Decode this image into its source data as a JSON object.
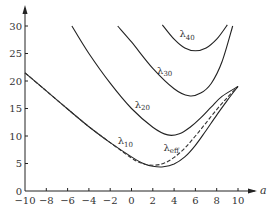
{
  "chart_data": {
    "type": "line",
    "title": "",
    "xlabel": "a",
    "ylabel": "",
    "xlim": [
      -10,
      11
    ],
    "ylim": [
      0,
      32
    ],
    "grid": false,
    "legend": "inline curve labels",
    "x_ticks": [
      -10,
      -8,
      -6,
      -4,
      -2,
      0,
      2,
      4,
      6,
      8,
      10
    ],
    "y_ticks": [
      0,
      5,
      10,
      15,
      20,
      25,
      30
    ],
    "series": [
      {
        "name": "λ10",
        "label_main": "λ",
        "label_sub": "10",
        "style": "solid",
        "label_pos": [
          -1.3,
          8.5
        ],
        "points": [
          [
            -10,
            21.5
          ],
          [
            -8,
            18.2
          ],
          [
            -6,
            14.9
          ],
          [
            -4,
            11.7
          ],
          [
            -2,
            8.8
          ],
          [
            0,
            6.2
          ],
          [
            1,
            5.1
          ],
          [
            2,
            4.5
          ],
          [
            3,
            4.4
          ],
          [
            4,
            4.9
          ],
          [
            5,
            6.2
          ],
          [
            6,
            8.3
          ],
          [
            7,
            11.0
          ],
          [
            8,
            13.8
          ],
          [
            9,
            16.5
          ],
          [
            10,
            19.0
          ]
        ]
      },
      {
        "name": "λeff",
        "label_main": "λ",
        "label_sub": "eff",
        "style": "dashed",
        "label_pos": [
          3.0,
          7.3
        ],
        "points": [
          [
            -10,
            21.5
          ],
          [
            -8,
            18.2
          ],
          [
            -6,
            14.9
          ],
          [
            -4,
            11.7
          ],
          [
            -2,
            8.8
          ],
          [
            0,
            6.0
          ],
          [
            1,
            5.0
          ],
          [
            2,
            4.7
          ],
          [
            3,
            5.0
          ],
          [
            4,
            6.1
          ],
          [
            5,
            7.8
          ],
          [
            6,
            10.0
          ],
          [
            7,
            12.4
          ],
          [
            8,
            14.8
          ],
          [
            9,
            17.0
          ],
          [
            10,
            19.0
          ]
        ]
      },
      {
        "name": "λ20",
        "label_main": "λ",
        "label_sub": "20",
        "style": "solid",
        "label_pos": [
          0.3,
          15.1
        ],
        "points": [
          [
            -5.6,
            30
          ],
          [
            -4,
            25.0
          ],
          [
            -2,
            19.6
          ],
          [
            0,
            15.0
          ],
          [
            2,
            11.6
          ],
          [
            3.4,
            10.2
          ],
          [
            4.5,
            10.4
          ],
          [
            5.5,
            11.6
          ],
          [
            6.5,
            13.3
          ],
          [
            7.5,
            15.3
          ],
          [
            8.5,
            17.2
          ],
          [
            10,
            19.0
          ]
        ]
      },
      {
        "name": "λ30",
        "label_main": "λ",
        "label_sub": "30",
        "style": "solid",
        "label_pos": [
          2.4,
          21.3
        ],
        "points": [
          [
            -1.3,
            30
          ],
          [
            0,
            27.1
          ],
          [
            2,
            22.3
          ],
          [
            4,
            18.6
          ],
          [
            5.4,
            17.3
          ],
          [
            6.5,
            17.8
          ],
          [
            7.5,
            19.6
          ],
          [
            8.5,
            23.5
          ],
          [
            9.5,
            30
          ]
        ]
      },
      {
        "name": "λ40",
        "label_main": "λ",
        "label_sub": "40",
        "style": "solid",
        "label_pos": [
          4.5,
          28.0
        ],
        "points": [
          [
            2.9,
            30.2
          ],
          [
            4,
            27.6
          ],
          [
            5,
            26.0
          ],
          [
            6,
            25.5
          ],
          [
            7,
            26.0
          ],
          [
            8,
            27.6
          ],
          [
            9,
            30.2
          ]
        ]
      }
    ]
  }
}
